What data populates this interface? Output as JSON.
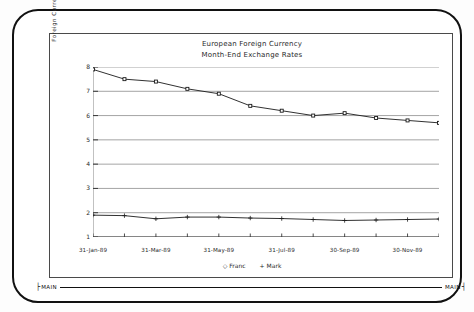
{
  "terminal": {
    "statusbar": {
      "left_cap": "├",
      "left_label": "MAIN",
      "right_label": "MAIN",
      "right_cap": "┤"
    }
  },
  "chart_data": {
    "type": "line",
    "title": "European Foreign Currency",
    "subtitle": "Month-End Exchange Rates",
    "xlabel": "",
    "ylabel": "Foreign Currency Per US Dollar",
    "ylim": [
      1,
      8
    ],
    "yticks": [
      1,
      2,
      3,
      4,
      5,
      6,
      7,
      8
    ],
    "ytick_labels": [
      "1",
      "2",
      "3",
      "4",
      "5",
      "6",
      "7",
      "8"
    ],
    "grid": true,
    "grid_axis": "y",
    "legend_position": "bottom",
    "categories": [
      "31-Jan-89",
      "28-Feb-89",
      "31-Mar-89",
      "30-Apr-89",
      "31-May-89",
      "30-Jun-89",
      "31-Jul-89",
      "31-Aug-89",
      "30-Sep-89",
      "31-Oct-89",
      "30-Nov-89",
      "31-Dec-89"
    ],
    "xtick_labels": [
      "31-Jan-89",
      "31-Mar-89",
      "31-May-89",
      "31-Jul-89",
      "30-Sep-89",
      "30-Nov-89"
    ],
    "xtick_indices": [
      0,
      2,
      4,
      6,
      8,
      10
    ],
    "series": [
      {
        "name": "Franc",
        "marker": "◇",
        "color": "#1a1a1a",
        "values": [
          7.9,
          7.5,
          7.4,
          7.1,
          6.9,
          6.4,
          6.2,
          6.0,
          6.1,
          5.9,
          5.8,
          5.7
        ]
      },
      {
        "name": "Mark",
        "marker": "+",
        "color": "#1a1a1a",
        "values": [
          1.9,
          1.88,
          1.75,
          1.82,
          1.82,
          1.78,
          1.76,
          1.72,
          1.68,
          1.7,
          1.72,
          1.74
        ]
      }
    ]
  }
}
